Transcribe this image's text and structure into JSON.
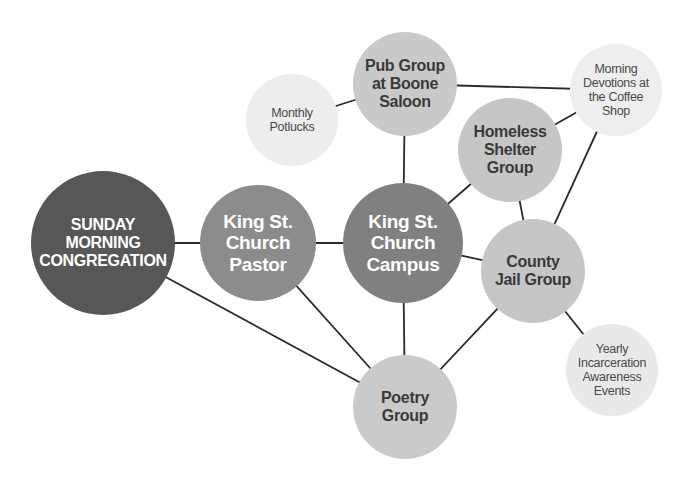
{
  "diagram": {
    "type": "network",
    "nodes": [
      {
        "id": "sunday",
        "label": "SUNDAY\nMORNING\nCONGREGATION",
        "x": 103,
        "y": 243,
        "r": 72,
        "color": "#575757",
        "style": "dark"
      },
      {
        "id": "pastor",
        "label": "King St.\nChurch\nPastor",
        "x": 258,
        "y": 243,
        "r": 58,
        "color": "#8c8c8c",
        "style": "mid"
      },
      {
        "id": "campus",
        "label": "King St.\nChurch\nCampus",
        "x": 403,
        "y": 243,
        "r": 60,
        "color": "#808080",
        "style": "mid"
      },
      {
        "id": "pub",
        "label": "Pub Group\nat Boone\nSaloon",
        "x": 405,
        "y": 84,
        "r": 52,
        "color": "#c9c9c9",
        "style": "light"
      },
      {
        "id": "potlucks",
        "label": "Monthly\nPotlucks",
        "x": 292,
        "y": 120,
        "r": 46,
        "color": "#ededed",
        "style": "pale"
      },
      {
        "id": "devotions",
        "label": "Morning\nDevotions at\nthe Coffee\nShop",
        "x": 616,
        "y": 90,
        "r": 46,
        "color": "#eeeeee",
        "style": "pale"
      },
      {
        "id": "shelter",
        "label": "Homeless\nShelter\nGroup",
        "x": 510,
        "y": 150,
        "r": 52,
        "color": "#c6c6c6",
        "style": "light"
      },
      {
        "id": "jail",
        "label": "County\nJail Group",
        "x": 533,
        "y": 271,
        "r": 52,
        "color": "#c6c6c6",
        "style": "light"
      },
      {
        "id": "yearly",
        "label": "Yearly\nIncarceration\nAwareness\nEvents",
        "x": 612,
        "y": 370,
        "r": 46,
        "color": "#e9e9e9",
        "style": "pale"
      },
      {
        "id": "poetry",
        "label": "Poetry\nGroup",
        "x": 405,
        "y": 407,
        "r": 52,
        "color": "#cacaca",
        "style": "light"
      }
    ],
    "edges": [
      [
        "sunday",
        "pastor"
      ],
      [
        "sunday",
        "poetry"
      ],
      [
        "pastor",
        "campus"
      ],
      [
        "pastor",
        "poetry"
      ],
      [
        "campus",
        "pub"
      ],
      [
        "campus",
        "shelter"
      ],
      [
        "campus",
        "jail"
      ],
      [
        "campus",
        "poetry"
      ],
      [
        "pub",
        "potlucks"
      ],
      [
        "pub",
        "devotions"
      ],
      [
        "shelter",
        "devotions"
      ],
      [
        "shelter",
        "jail"
      ],
      [
        "devotions",
        "jail"
      ],
      [
        "jail",
        "poetry"
      ],
      [
        "jail",
        "yearly"
      ]
    ],
    "edge_color": "#2b2b2b"
  }
}
